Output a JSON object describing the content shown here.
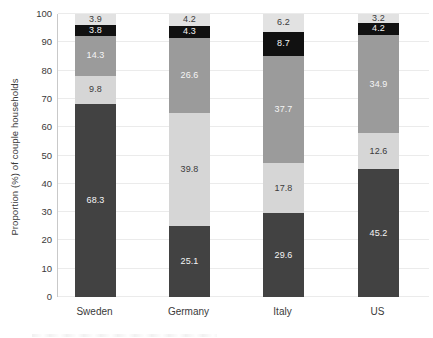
{
  "chart_data": {
    "type": "stacked-bar",
    "title": "",
    "categories": [
      "Sweden",
      "Germany",
      "Italy",
      "US"
    ],
    "series": [
      {
        "name": "bottom-dark-gray-segment",
        "color": "#424242",
        "label_color": "#f5f5f5",
        "values": [
          68.3,
          25.1,
          29.6,
          45.2
        ]
      },
      {
        "name": "light-gray-segment",
        "color": "#d6d6d6",
        "label_color": "#3b3b3b",
        "values": [
          9.8,
          39.8,
          17.8,
          12.6
        ]
      },
      {
        "name": "medium-gray-segment",
        "color": "#9b9b9b",
        "label_color": "#f5f5f5",
        "values": [
          14.3,
          26.6,
          37.7,
          34.9
        ]
      },
      {
        "name": "black-segment",
        "color": "#111111",
        "label_color": "#f5f5f5",
        "values": [
          3.8,
          4.3,
          8.7,
          4.2
        ]
      },
      {
        "name": "top-lightest-gray-segment",
        "color": "#e2e2e2",
        "label_color": "#3b3b3b",
        "values": [
          3.9,
          4.2,
          6.2,
          3.2
        ]
      }
    ],
    "xlabel": "",
    "ylabel": "Proportion (%) of couple households",
    "ylim": [
      0,
      100
    ],
    "yticks": [
      0,
      10,
      20,
      30,
      40,
      50,
      60,
      70,
      80,
      90,
      100
    ],
    "grid": true,
    "legend": "none",
    "data_labels": "inside-center"
  }
}
